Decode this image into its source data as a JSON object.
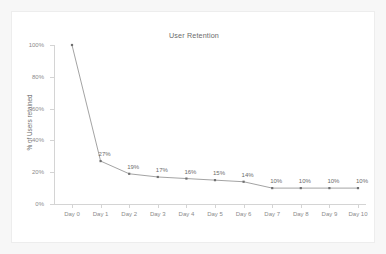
{
  "card": {
    "background_color": "#ffffff",
    "border_color": "#ededed",
    "page_background_color": "#f7f7f7"
  },
  "chart_data": {
    "type": "line",
    "title": "User Retention",
    "xlabel": "",
    "ylabel": "% of Users retained",
    "categories": [
      "Day 0",
      "Day 1",
      "Day 2",
      "Day 3",
      "Day 4",
      "Day 5",
      "Day 6",
      "Day 7",
      "Day 8",
      "Day 9",
      "Day 10"
    ],
    "values": [
      100,
      27,
      19,
      17,
      16,
      15,
      14,
      10,
      10,
      10,
      10
    ],
    "point_labels": [
      "",
      "27%",
      "19%",
      "17%",
      "16%",
      "15%",
      "14%",
      "10%",
      "10%",
      "10%",
      "10%"
    ],
    "ylim": [
      0,
      100
    ],
    "ytick_values": [
      0,
      20,
      40,
      60,
      80,
      100
    ],
    "ytick_labels": [
      "0%",
      "20%",
      "40%",
      "60%",
      "80%",
      "100%"
    ],
    "grid": false,
    "legend": "none",
    "line_color": "#8c8c8c",
    "marker_color": "#6f6f6f",
    "marker": "square",
    "axis_color": "#d4d4d4",
    "tick_label_color": "#8a8a8a",
    "title_color": "#6b6b6b"
  }
}
